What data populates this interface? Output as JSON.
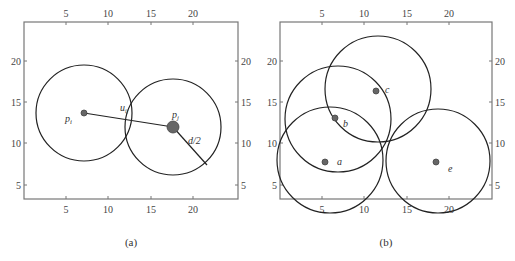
{
  "panels": [
    {
      "id": "a",
      "caption": "(a)",
      "frame": {
        "x": 24,
        "y": 22,
        "w": 214,
        "h": 177
      },
      "x_ticks": [
        {
          "v": "5",
          "px": 66
        },
        {
          "v": "10",
          "px": 108
        },
        {
          "v": "15",
          "px": 151
        },
        {
          "v": "20",
          "px": 193
        }
      ],
      "y_ticks": [
        {
          "v": "20",
          "py": 61
        },
        {
          "v": "15",
          "py": 102
        },
        {
          "v": "10",
          "py": 143
        },
        {
          "v": "5",
          "py": 185
        }
      ],
      "circles": [
        {
          "name": "circle-i",
          "cx": 84,
          "cy": 113,
          "r": 48
        },
        {
          "name": "circle-j",
          "cx": 173,
          "cy": 127,
          "r": 48
        }
      ],
      "points": [
        {
          "name": "point-pi",
          "cx": 84,
          "cy": 113,
          "r": 3,
          "label": "p",
          "sub": "i",
          "lx": 65,
          "ly": 122
        },
        {
          "name": "point-pj",
          "cx": 173,
          "cy": 127,
          "r": 6,
          "label": "p",
          "sub": "j",
          "lx": 172,
          "ly": 118
        }
      ],
      "segments": [
        {
          "name": "segment-pi-pj",
          "x1": 84,
          "y1": 113,
          "x2": 173,
          "y2": 127
        },
        {
          "name": "radius-segment",
          "x1": 173,
          "y1": 127,
          "x2": 207,
          "y2": 165
        }
      ],
      "annotations": [
        {
          "name": "label-uij",
          "text": "u",
          "sub": "ij",
          "x": 120,
          "y": 111
        },
        {
          "name": "label-d-half",
          "text": "d/2",
          "x": 188,
          "y": 144
        }
      ]
    },
    {
      "id": "b",
      "caption": "(b)",
      "frame": {
        "x": 280,
        "y": 22,
        "w": 212,
        "h": 177
      },
      "x_ticks": [
        {
          "v": "5",
          "px": 322
        },
        {
          "v": "10",
          "px": 364
        },
        {
          "v": "15",
          "px": 407
        },
        {
          "v": "20",
          "px": 449
        }
      ],
      "y_ticks": [
        {
          "v": "20",
          "py": 61
        },
        {
          "v": "15",
          "py": 102
        },
        {
          "v": "10",
          "py": 143
        },
        {
          "v": "5",
          "py": 185
        }
      ],
      "circles": [
        {
          "name": "circle-a",
          "cx": 330,
          "cy": 160,
          "r": 53
        },
        {
          "name": "circle-b",
          "cx": 338,
          "cy": 119,
          "r": 53
        },
        {
          "name": "circle-c",
          "cx": 378,
          "cy": 89,
          "r": 53
        },
        {
          "name": "circle-e",
          "cx": 438,
          "cy": 161,
          "r": 52
        }
      ],
      "points": [
        {
          "name": "point-a",
          "cx": 325,
          "cy": 162,
          "r": 3,
          "label": "a",
          "lx": 337,
          "ly": 165
        },
        {
          "name": "point-b",
          "cx": 335,
          "cy": 118,
          "r": 3,
          "label": "b",
          "lx": 343,
          "ly": 127
        },
        {
          "name": "point-c",
          "cx": 376,
          "cy": 91,
          "r": 3,
          "label": "c",
          "lx": 385,
          "ly": 93
        },
        {
          "name": "point-e",
          "cx": 436,
          "cy": 162,
          "r": 3,
          "label": "e",
          "lx": 448,
          "ly": 172
        }
      ]
    }
  ],
  "colors": {
    "stroke": "#222222",
    "frame": "#777777",
    "point": "#666666"
  }
}
